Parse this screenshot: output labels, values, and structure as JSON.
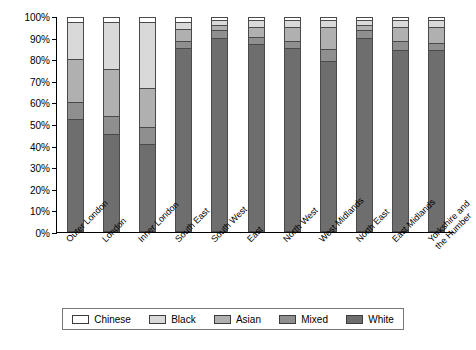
{
  "chart_data": {
    "type": "bar",
    "subtype": "stacked-percentage-column",
    "title": "",
    "xlabel": "",
    "ylabel": "",
    "ylim": [
      0,
      100
    ],
    "ytick_labels": [
      "100%",
      "90%",
      "80%",
      "70%",
      "60%",
      "50%",
      "40%",
      "30%",
      "20%",
      "10%",
      "0%"
    ],
    "ytick_values": [
      100,
      90,
      80,
      70,
      60,
      50,
      40,
      30,
      20,
      10,
      0
    ],
    "grid": false,
    "legend_position": "bottom",
    "categories": [
      "Outer London",
      "London",
      "Inner London",
      "South East",
      "South West",
      "East",
      "North West",
      "West Midlands",
      "North East",
      "East Midlands",
      "Yorkshire and\nthe Humber"
    ],
    "series": [
      {
        "name": "White",
        "color": "#6e6e6e",
        "values": [
          53,
          46,
          41,
          87,
          92,
          89,
          87,
          81,
          92,
          86,
          86
        ]
      },
      {
        "name": "Mixed",
        "color": "#8f8f8f",
        "values": [
          8,
          8,
          8,
          3,
          3,
          3,
          3,
          5,
          3,
          4,
          3
        ]
      },
      {
        "name": "Asian",
        "color": "#b0b0b0",
        "values": [
          20,
          22,
          18,
          5,
          2,
          4,
          6,
          10,
          2,
          6,
          7
        ]
      },
      {
        "name": "Black",
        "color": "#d9d9d9",
        "values": [
          17,
          22,
          31,
          3,
          2,
          3,
          3,
          3,
          2,
          3,
          3
        ]
      },
      {
        "name": "Chinese",
        "color": "#ffffff",
        "values": [
          2,
          2,
          2,
          2,
          1,
          1,
          1,
          1,
          1,
          1,
          1
        ]
      }
    ],
    "legend_entries": [
      {
        "label": "Chinese",
        "color": "#ffffff"
      },
      {
        "label": "Black",
        "color": "#d9d9d9"
      },
      {
        "label": "Asian",
        "color": "#b0b0b0"
      },
      {
        "label": "Mixed",
        "color": "#8f8f8f"
      },
      {
        "label": "White",
        "color": "#6e6e6e"
      }
    ]
  }
}
